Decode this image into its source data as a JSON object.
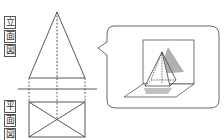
{
  "labels": {
    "elevation": [
      "立",
      "面",
      "図"
    ],
    "plan": [
      "平",
      "面",
      "図"
    ]
  },
  "colors": {
    "line": "#444444",
    "shadow": "#aaaaaa",
    "bubble_border": "#555555"
  },
  "diagram": {
    "elevation_view": "triangle (pyramid front view)",
    "plan_view": "rectangle with diagonals (pyramid top view)",
    "callout": "3D pyramid on horizontal and vertical projection planes with shadows"
  }
}
